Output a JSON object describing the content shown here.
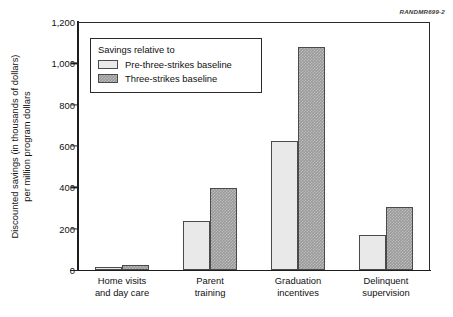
{
  "figure_id": "RANDMR699-2",
  "legend": {
    "title": "Savings relative to",
    "entries": [
      {
        "label": "Pre-three-strikes baseline",
        "swatch": "light-gray-swatch",
        "color": "#e9e9e9"
      },
      {
        "label": "Three-strikes baseline",
        "swatch": "dark-gray-swatch",
        "color": "#9a9a9a"
      }
    ]
  },
  "axis": {
    "y_title_line1": "Discounted savings (in thousands of dollars)",
    "y_title_line2": "per million program dollars",
    "y_ticks": [
      "0",
      "200",
      "400",
      "600",
      "800",
      "1,000",
      "1,200"
    ]
  },
  "chart_data": {
    "type": "bar",
    "title": "",
    "xlabel": "",
    "ylabel": "Discounted savings (in thousands of dollars) per million program dollars",
    "ylim": [
      0,
      1200
    ],
    "ytick_values": [
      0,
      200,
      400,
      600,
      800,
      1000,
      1200
    ],
    "grid": false,
    "legend_position": "upper-left-inside",
    "categories": [
      "Home visits and day care",
      "Parent training",
      "Graduation incentives",
      "Delinquent supervision"
    ],
    "category_lines": [
      [
        "Home visits",
        "and day care"
      ],
      [
        "Parent",
        "training"
      ],
      [
        "Graduation",
        "incentives"
      ],
      [
        "Delinquent",
        "supervision"
      ]
    ],
    "series": [
      {
        "name": "Pre-three-strikes baseline",
        "color": "#e9e9e9",
        "values": [
          15,
          235,
          625,
          170
        ]
      },
      {
        "name": "Three-strikes baseline",
        "color": "#9a9a9a",
        "values": [
          25,
          395,
          1080,
          305
        ]
      }
    ]
  }
}
